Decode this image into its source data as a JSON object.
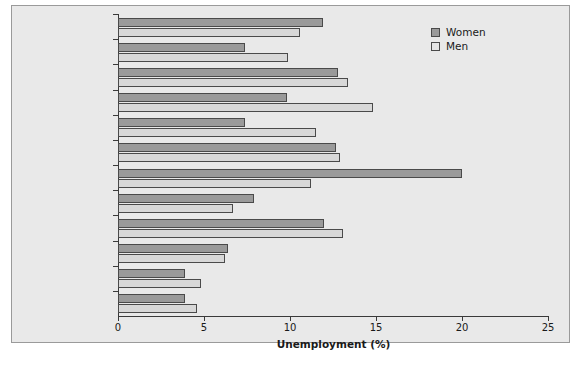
{
  "chart_data": {
    "type": "bar",
    "orientation": "horizontal",
    "title": "",
    "xlabel": "Unemployment (%)",
    "ylabel": "",
    "xlim": [
      0,
      25
    ],
    "xticks": [
      0,
      5,
      10,
      15,
      20,
      25
    ],
    "xticklabels": [
      "0",
      "5",
      "10",
      "15",
      "20",
      "25"
    ],
    "grid": false,
    "legend_position": "top-right",
    "categories": [
      "Other ethnic groups",
      "Chinese",
      "Black African",
      "Black Caribbean",
      "Other Asian",
      "Bangladeshi",
      "Pakistani",
      "Indian",
      "Mixed",
      "Other White",
      "White Irish",
      "White British"
    ],
    "series": [
      {
        "name": "Women",
        "color": "#9a9a9a",
        "values": [
          11.9,
          7.4,
          12.8,
          9.8,
          7.4,
          12.7,
          20.0,
          7.9,
          12.0,
          6.4,
          3.9,
          3.9
        ]
      },
      {
        "name": "Men",
        "color": "#d8d8d8",
        "values": [
          10.6,
          9.9,
          13.4,
          14.8,
          11.5,
          12.9,
          11.2,
          6.7,
          13.1,
          6.2,
          4.8,
          4.6
        ]
      }
    ]
  },
  "legend": {
    "entries": [
      {
        "label": "Women",
        "swatch": "women"
      },
      {
        "label": "Men",
        "swatch": "men"
      }
    ]
  },
  "colors": {
    "figure_background": "#e9e9e9",
    "figure_border": "#9a9a9a",
    "axis": "#3a3a3a",
    "women_fill": "#9a9a9a",
    "men_fill": "#d8d8d8",
    "bar_outline": "#4a4a4a",
    "text": "#1a1a1a"
  }
}
